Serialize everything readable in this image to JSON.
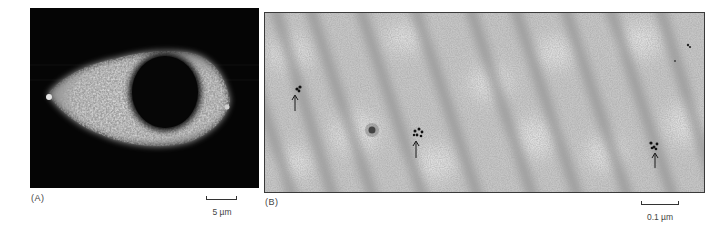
{
  "figure": {
    "panels": [
      {
        "id": "A",
        "label": "(A)",
        "description": "Fluorescence micrograph of a single cell; bright granular cytoplasm surrounding a dark round nucleus",
        "scale_bar": {
          "label": "5 µm"
        }
      },
      {
        "id": "B",
        "label": "(B)",
        "description": "Electron micrograph with diagonal striations; clusters of gold particles marked by arrows",
        "scale_bar": {
          "label": "0.1 µm"
        },
        "annotations": [
          {
            "type": "arrow",
            "points": "up",
            "target": "gold-particle-cluster"
          },
          {
            "type": "arrow",
            "points": "up",
            "target": "gold-particle-cluster"
          },
          {
            "type": "arrow",
            "points": "up",
            "target": "gold-particle-cluster"
          }
        ]
      }
    ],
    "colors": {
      "panel_a_background": "#050505",
      "panel_a_signal": "#e8e8e8",
      "panel_b_background": "#c4c4c4",
      "panel_b_striation": "#8a8a8a",
      "text": "#444444"
    }
  }
}
